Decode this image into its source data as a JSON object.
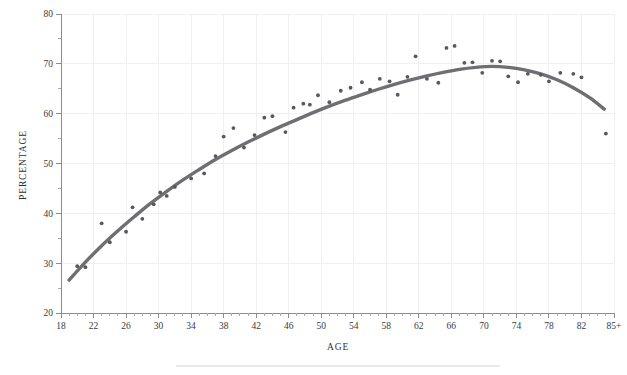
{
  "chart_data": {
    "type": "scatter",
    "title": "",
    "subtitle": "",
    "xlabel": "AGE",
    "ylabel": "PERCENTAGE",
    "xlim": [
      18,
      86
    ],
    "ylim": [
      20,
      80
    ],
    "grid": true,
    "legend": null,
    "x_ticks": [
      18,
      22,
      26,
      30,
      34,
      38,
      42,
      46,
      50,
      54,
      58,
      62,
      66,
      70,
      74,
      78,
      82,
      86
    ],
    "x_tick_labels": [
      "18",
      "22",
      "26",
      "30",
      "34",
      "38",
      "42",
      "46",
      "50",
      "54",
      "58",
      "62",
      "66",
      "70",
      "74",
      "78",
      "82",
      "85+"
    ],
    "x_minor_tick_step": 1,
    "y_ticks": [
      20,
      30,
      40,
      50,
      60,
      70,
      80
    ],
    "y_tick_labels": [
      "20",
      "30",
      "40",
      "50",
      "60",
      "70",
      "80"
    ],
    "y_minor_tick_step": 5,
    "marker_color": "#58585d",
    "curve_color": "#6e6e73",
    "grid_color": "#f0f0f2",
    "axis_color": "#8b8b90",
    "series": [
      {
        "name": "observed",
        "type": "scatter",
        "points": [
          [
            20,
            29.4
          ],
          [
            21,
            29.2
          ],
          [
            23,
            38.0
          ],
          [
            24,
            34.2
          ],
          [
            26,
            36.3
          ],
          [
            26.8,
            41.2
          ],
          [
            28,
            38.9
          ],
          [
            29.4,
            41.8
          ],
          [
            30.2,
            44.2
          ],
          [
            31,
            43.5
          ],
          [
            32,
            45.3
          ],
          [
            34,
            47.0
          ],
          [
            35.6,
            48.0
          ],
          [
            37,
            51.5
          ],
          [
            38,
            55.4
          ],
          [
            39.2,
            57.1
          ],
          [
            40.5,
            53.2
          ],
          [
            41.8,
            55.7
          ],
          [
            43,
            59.2
          ],
          [
            44,
            59.5
          ],
          [
            45.6,
            56.3
          ],
          [
            46.6,
            61.2
          ],
          [
            47.8,
            62.0
          ],
          [
            48.6,
            61.8
          ],
          [
            49.6,
            63.7
          ],
          [
            51,
            62.3
          ],
          [
            52.4,
            64.6
          ],
          [
            53.6,
            65.2
          ],
          [
            55,
            66.3
          ],
          [
            56,
            64.8
          ],
          [
            57.2,
            67.0
          ],
          [
            58.4,
            66.5
          ],
          [
            59.4,
            63.8
          ],
          [
            60.6,
            67.4
          ],
          [
            61.6,
            71.5
          ],
          [
            63,
            67.0
          ],
          [
            64.4,
            66.2
          ],
          [
            65.4,
            73.2
          ],
          [
            66.4,
            73.6
          ],
          [
            67.6,
            70.2
          ],
          [
            68.6,
            70.3
          ],
          [
            69.8,
            68.2
          ],
          [
            71,
            70.6
          ],
          [
            72,
            70.5
          ],
          [
            73,
            67.5
          ],
          [
            74.2,
            66.3
          ],
          [
            75.4,
            68.0
          ],
          [
            77,
            67.8
          ],
          [
            78,
            66.5
          ],
          [
            79.4,
            68.2
          ],
          [
            81,
            68.0
          ],
          [
            82,
            67.3
          ],
          [
            85,
            56.0
          ]
        ]
      },
      {
        "name": "fitted-trend",
        "type": "line",
        "points": [
          [
            19,
            26.6
          ],
          [
            21,
            30.2
          ],
          [
            23,
            33.5
          ],
          [
            25,
            36.5
          ],
          [
            27,
            39.3
          ],
          [
            29,
            42.0
          ],
          [
            31,
            44.4
          ],
          [
            33,
            46.7
          ],
          [
            35,
            48.8
          ],
          [
            37,
            50.8
          ],
          [
            39,
            52.6
          ],
          [
            41,
            54.3
          ],
          [
            43,
            55.9
          ],
          [
            45,
            57.4
          ],
          [
            47,
            58.8
          ],
          [
            49,
            60.2
          ],
          [
            51,
            61.5
          ],
          [
            53,
            62.7
          ],
          [
            55,
            63.8
          ],
          [
            57,
            64.9
          ],
          [
            59,
            65.9
          ],
          [
            61,
            66.8
          ],
          [
            63,
            67.6
          ],
          [
            65,
            68.3
          ],
          [
            67,
            68.9
          ],
          [
            69,
            69.3
          ],
          [
            71,
            69.5
          ],
          [
            73,
            69.3
          ],
          [
            75,
            68.8
          ],
          [
            77,
            68.0
          ],
          [
            79,
            66.8
          ],
          [
            81,
            65.2
          ],
          [
            83,
            63.2
          ],
          [
            84.8,
            60.9
          ]
        ]
      }
    ]
  },
  "axis_titles": {
    "x": "AGE",
    "y": "PERCENTAGE"
  }
}
